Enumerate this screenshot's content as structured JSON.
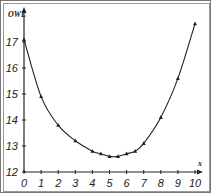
{
  "chart_data": {
    "type": "line",
    "title": "",
    "xlabel": "x",
    "ylabel": "OWL",
    "xlim": [
      0,
      10
    ],
    "ylim": [
      12,
      18
    ],
    "grid": false,
    "x_ticks": [
      "0",
      "1",
      "2",
      "3",
      "4",
      "5",
      "6",
      "7",
      "8",
      "9",
      "10"
    ],
    "y_ticks": [
      "12",
      "13",
      "14",
      "15",
      "16",
      "17"
    ],
    "series": [
      {
        "name": "OWL",
        "x": [
          0,
          1,
          2,
          3,
          4,
          4.5,
          5,
          5.5,
          6,
          6.5,
          7,
          8,
          9,
          10
        ],
        "values": [
          17.1,
          14.9,
          13.8,
          13.2,
          12.8,
          12.7,
          12.6,
          12.6,
          12.7,
          12.8,
          13.1,
          14.1,
          15.6,
          17.7
        ]
      }
    ]
  }
}
